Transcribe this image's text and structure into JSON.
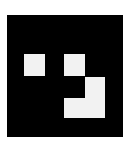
{
  "figure": {
    "background": "#ffffff",
    "board_color": "#000000",
    "block_color": "#f2f2f2",
    "blocks": [
      {
        "name": "left-square",
        "x": 17,
        "y": 39,
        "w": 21,
        "h": 22
      },
      {
        "name": "top-right-square",
        "x": 57,
        "y": 39,
        "w": 21,
        "h": 22
      },
      {
        "name": "l-shape-vertical",
        "x": 78,
        "y": 62,
        "w": 20,
        "h": 41
      },
      {
        "name": "l-shape-bottom",
        "x": 57,
        "y": 83,
        "w": 41,
        "h": 20
      }
    ]
  }
}
